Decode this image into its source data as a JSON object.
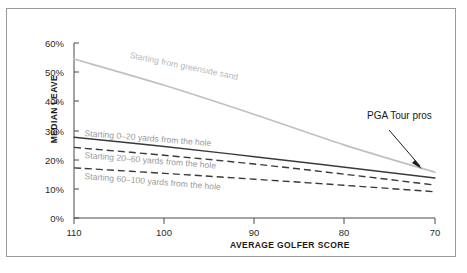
{
  "chart_data": {
    "type": "line",
    "title": "",
    "xlabel": "AVERAGE GOLFER SCORE",
    "ylabel": "MEDIAN LEAVE",
    "xlim": [
      110,
      70
    ],
    "ylim": [
      0,
      60
    ],
    "x_ticks": [
      "110",
      "100",
      "90",
      "80",
      "70"
    ],
    "x_tick_values": [
      110,
      100,
      90,
      80,
      70
    ],
    "y_ticks": [
      "0%",
      "10%",
      "20%",
      "30%",
      "40%",
      "50%",
      "60%"
    ],
    "y_tick_values": [
      0,
      10,
      20,
      30,
      40,
      50,
      60
    ],
    "grid": false,
    "legend_position": "inline-labels",
    "x": [
      110,
      100,
      90,
      80,
      70
    ],
    "series": [
      {
        "name": "Starting from greenside sand",
        "style": "solid",
        "color": "#c0c0c0",
        "values": [
          54.5,
          45.5,
          35.5,
          25.0,
          15.7
        ]
      },
      {
        "name": "Starting 0–20 yards from the hole",
        "style": "solid",
        "color": "#3a3a3a",
        "values": [
          27.7,
          24.5,
          21.0,
          17.4,
          13.7
        ]
      },
      {
        "name": "Starting 20–60 yards from the hole",
        "style": "dashed",
        "color": "#3a3a3a",
        "values": [
          24.2,
          21.5,
          18.5,
          15.0,
          11.3
        ]
      },
      {
        "name": "Starting 60–100 yards from the hole",
        "style": "dashed",
        "color": "#3a3a3a",
        "values": [
          17.2,
          15.3,
          13.3,
          11.2,
          9.0
        ]
      }
    ],
    "annotations": [
      {
        "text": "PGA Tour pros",
        "points_to_x": 70,
        "points_to_y": 15.7
      }
    ]
  }
}
